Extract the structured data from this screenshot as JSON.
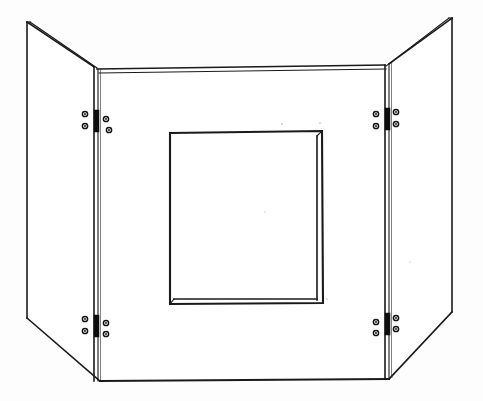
{
  "figure": {
    "title": "Tri-fold hinged panel screen with central rectangular aperture",
    "kind": "technical-line-drawing",
    "background_color": "#fdfdfd",
    "line_color": "#1a1a1a",
    "hinge_color": "#0d0d0d",
    "canvas": {
      "width": 483,
      "height": 401
    },
    "parts": [
      {
        "id": "left-wing",
        "label": "Left hinged wing panel"
      },
      {
        "id": "center-panel",
        "label": "Center front panel"
      },
      {
        "id": "right-wing",
        "label": "Right hinged wing panel"
      },
      {
        "id": "aperture",
        "label": "Central rectangular opening"
      }
    ],
    "hinges": [
      {
        "id": "hinge-left-top",
        "label": "Left upper hinge",
        "x": 97,
        "y": 121,
        "side": "left"
      },
      {
        "id": "hinge-left-bottom",
        "label": "Left lower hinge",
        "x": 97,
        "y": 326,
        "side": "left"
      },
      {
        "id": "hinge-right-top",
        "label": "Right upper hinge",
        "x": 386,
        "y": 119,
        "side": "right"
      },
      {
        "id": "hinge-right-bottom",
        "label": "Right lower hinge",
        "x": 386,
        "y": 324,
        "side": "right"
      }
    ],
    "screws_per_hinge": 4
  },
  "geometry": {
    "left_wing": {
      "outer_top": [
        27,
        22
      ],
      "outer_bottom": [
        27,
        318
      ],
      "fold_top": [
        94,
        66
      ],
      "fold_bottom": [
        94,
        381
      ],
      "thickness_offset": 4
    },
    "center_panel": {
      "top_left": [
        100,
        66
      ],
      "top_right": [
        383,
        62
      ],
      "bottom_left": [
        103,
        381
      ],
      "bottom_right": [
        389,
        379
      ],
      "top_band": 6
    },
    "right_wing": {
      "outer_top": [
        452,
        18
      ],
      "outer_bottom": [
        452,
        312
      ],
      "fold_top": [
        389,
        62
      ],
      "fold_bottom": [
        389,
        379
      ],
      "thickness_offset": 4
    },
    "aperture": {
      "top_left": [
        170,
        132
      ],
      "top_right": [
        322,
        132
      ],
      "bottom_right": [
        322,
        303
      ],
      "bottom_left": [
        170,
        303
      ],
      "inner_offset": 5
    }
  }
}
